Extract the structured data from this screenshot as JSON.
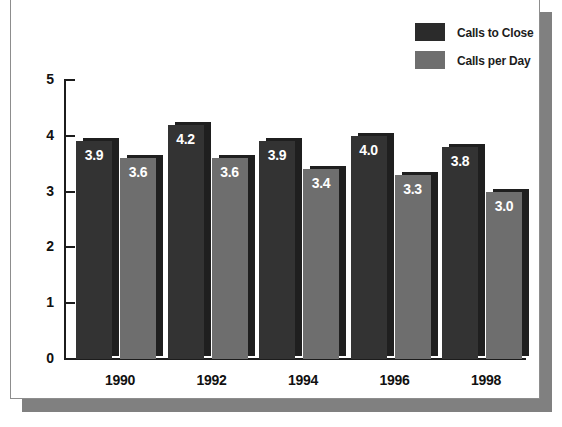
{
  "chart_data": {
    "type": "bar",
    "title": "",
    "subtitle": "",
    "xlabel": "",
    "ylabel": "",
    "categories": [
      "1990",
      "1992",
      "1994",
      "1996",
      "1998"
    ],
    "series": [
      {
        "name": "Calls to Close",
        "color": "#333333",
        "values": [
          3.9,
          4.2,
          3.9,
          4.0,
          3.8
        ],
        "labels": [
          "3.9",
          "4.2",
          "3.9",
          "4.0",
          "3.8"
        ]
      },
      {
        "name": "Calls per Day",
        "color": "#6e6e6e",
        "values": [
          3.6,
          3.6,
          3.4,
          3.3,
          3.0
        ],
        "labels": [
          "3.6",
          "3.6",
          "3.4",
          "3.3",
          "3.0"
        ]
      }
    ],
    "ylim": [
      0,
      5
    ],
    "yticks": [
      0,
      1,
      2,
      3,
      4,
      5
    ],
    "ytick_labels": [
      "0",
      "1",
      "2",
      "3",
      "4",
      "5"
    ],
    "grid": false,
    "legend_position": "top-right",
    "legend": [
      {
        "label": "Calls to Close",
        "swatch": "#2b2b2b"
      },
      {
        "label": "Calls per Day",
        "swatch": "#6e6e6e"
      }
    ]
  },
  "colors": {
    "series_dark": "#333333",
    "series_gray": "#6e6e6e",
    "axis": "#1c1c1c",
    "text": "#111111",
    "value_text": "#ffffff",
    "panel_background": "#ffffff",
    "panel_shadow": "#808080",
    "panel_border": "#8d8d8d"
  }
}
